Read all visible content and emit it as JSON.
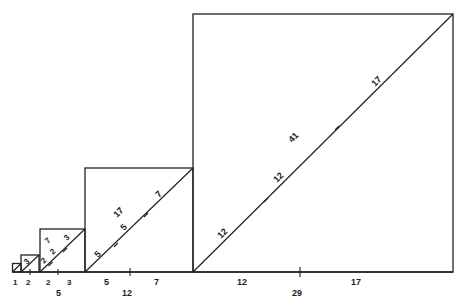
{
  "diagram": {
    "title": "",
    "colors": {
      "stroke": "#222222",
      "background": "#ffffff"
    },
    "squares": [
      {
        "side": 1,
        "base_labels": [
          "1"
        ],
        "diagonal_labels": [],
        "total_label": ""
      },
      {
        "side": 2,
        "base_labels": [
          "2"
        ],
        "diagonal_labels": [
          "3"
        ],
        "total_label": ""
      },
      {
        "side": 5,
        "base_labels": [
          "2",
          "3"
        ],
        "diagonal_labels": [
          "2",
          "2",
          "3"
        ],
        "inner_label": "7",
        "total_label": "5"
      },
      {
        "side": 12,
        "base_labels": [
          "5",
          "7"
        ],
        "diagonal_labels": [
          "5",
          "5",
          "7"
        ],
        "inner_label": "17",
        "total_label": "12"
      },
      {
        "side": 29,
        "base_labels": [
          "12",
          "17"
        ],
        "diagonal_labels": [
          "12",
          "12",
          "17"
        ],
        "inner_label": "41",
        "total_label": "29"
      }
    ],
    "labels": {
      "sq1_base": "1",
      "sq2_base": "2",
      "sq2_diag": "3",
      "sq5_base_a": "2",
      "sq5_base_b": "3",
      "sq5_total": "5",
      "sq5_diag_a": "2",
      "sq5_diag_b": "2",
      "sq5_diag_c": "3",
      "sq5_inner": "7",
      "sq12_base_a": "5",
      "sq12_base_b": "7",
      "sq12_total": "12",
      "sq12_diag_a": "5",
      "sq12_diag_b": "5",
      "sq12_diag_c": "7",
      "sq12_inner": "17",
      "sq29_base_a": "12",
      "sq29_base_b": "17",
      "sq29_total": "29",
      "sq29_diag_a": "12",
      "sq29_diag_b": "12",
      "sq29_diag_c": "17",
      "sq29_inner": "41"
    }
  }
}
